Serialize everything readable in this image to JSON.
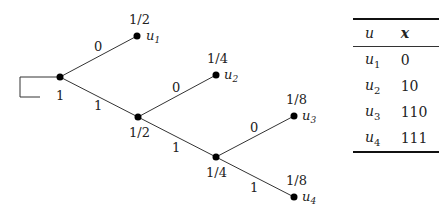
{
  "tree": {
    "root": {
      "prob": "1"
    },
    "nodes": [
      {
        "id": "n1",
        "prob": "1"
      },
      {
        "id": "n2",
        "prob": "1/2"
      },
      {
        "id": "n3",
        "prob": "1/4"
      }
    ],
    "leaves": [
      {
        "name": "u",
        "sub": "1",
        "prob": "1/2"
      },
      {
        "name": "u",
        "sub": "2",
        "prob": "1/4"
      },
      {
        "name": "u",
        "sub": "3",
        "prob": "1/8"
      },
      {
        "name": "u",
        "sub": "4",
        "prob": "1/8"
      }
    ],
    "edges": [
      {
        "from": "n1",
        "to": "u1",
        "label": "0"
      },
      {
        "from": "n1",
        "to": "n2",
        "label": "1"
      },
      {
        "from": "n2",
        "to": "u2",
        "label": "0"
      },
      {
        "from": "n2",
        "to": "n3",
        "label": "1"
      },
      {
        "from": "n3",
        "to": "u3",
        "label": "0"
      },
      {
        "from": "n3",
        "to": "u4",
        "label": "1"
      }
    ]
  },
  "table": {
    "headers": {
      "u": "u",
      "x": "x"
    },
    "rows": [
      {
        "u": "u",
        "sub": "1",
        "x": "0"
      },
      {
        "u": "u",
        "sub": "2",
        "x": "10"
      },
      {
        "u": "u",
        "sub": "3",
        "x": "110"
      },
      {
        "u": "u",
        "sub": "4",
        "x": "111"
      }
    ]
  }
}
